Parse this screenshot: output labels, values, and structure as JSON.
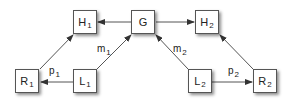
{
  "diagram": {
    "nodes": [
      {
        "id": "H1",
        "base": "H",
        "sub": "1",
        "x": 73,
        "y": 10
      },
      {
        "id": "G",
        "base": "G",
        "sub": "",
        "x": 131,
        "y": 10
      },
      {
        "id": "H2",
        "base": "H",
        "sub": "2",
        "x": 195,
        "y": 10
      },
      {
        "id": "R1",
        "base": "R",
        "sub": "1",
        "x": 15,
        "y": 69
      },
      {
        "id": "L1",
        "base": "L",
        "sub": "1",
        "x": 73,
        "y": 69
      },
      {
        "id": "L2",
        "base": "L",
        "sub": "2",
        "x": 188,
        "y": 69
      },
      {
        "id": "R2",
        "base": "R",
        "sub": "2",
        "x": 253,
        "y": 69
      }
    ],
    "edges": [
      {
        "from": "G",
        "to": "H1",
        "label": ""
      },
      {
        "from": "G",
        "to": "H2",
        "label": ""
      },
      {
        "from": "R1",
        "to": "H1",
        "label": ""
      },
      {
        "from": "L1",
        "to": "R1",
        "label": "p1"
      },
      {
        "from": "L1",
        "to": "G",
        "label": "m1"
      },
      {
        "from": "L2",
        "to": "G",
        "label": "m2"
      },
      {
        "from": "L2",
        "to": "R2",
        "label": "p2"
      },
      {
        "from": "R2",
        "to": "H2",
        "label": ""
      }
    ],
    "labels": {
      "p1": {
        "base": "p",
        "sub": "1"
      },
      "m1": {
        "base": "m",
        "sub": "1"
      },
      "m2": {
        "base": "m",
        "sub": "2"
      },
      "p2": {
        "base": "p",
        "sub": "2"
      }
    },
    "colors": {
      "line": "#555555",
      "box_border": "#555555",
      "text": "#222222"
    }
  }
}
